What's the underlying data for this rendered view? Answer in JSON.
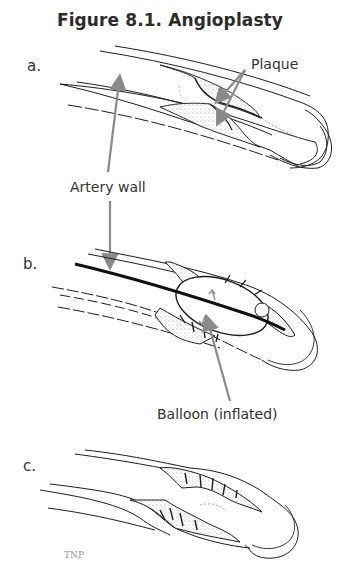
{
  "figure": {
    "title": "Figure 8.1. Angioplasty",
    "panels": [
      {
        "id": "a",
        "label": "a."
      },
      {
        "id": "b",
        "label": "b."
      },
      {
        "id": "c",
        "label": "c."
      }
    ],
    "callouts": {
      "plaque": "Plaque",
      "artery_wall": "Artery wall",
      "balloon": "Balloon (inflated)"
    },
    "signature": "TNP",
    "colors": {
      "line": "#1e1e1e",
      "arrow": "#8a8a8a",
      "plaque_stipple": "#bdbdbd",
      "background": "#ffffff"
    }
  }
}
